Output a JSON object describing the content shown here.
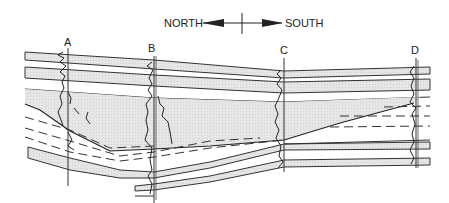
{
  "compass": {
    "north_label": "NORTH",
    "south_label": "SOUTH"
  },
  "wells": [
    {
      "label": "A",
      "x": 68
    },
    {
      "label": "B",
      "x": 154
    },
    {
      "label": "C",
      "x": 284
    },
    {
      "label": "D",
      "x": 416
    }
  ],
  "colors": {
    "line": "#333333",
    "shade": "#e2e2e2",
    "background": "#ffffff"
  }
}
